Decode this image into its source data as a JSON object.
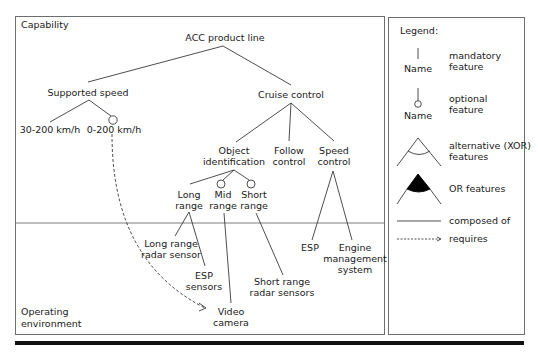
{
  "regions": {
    "capability": "Capability",
    "operating_environment_line1": "Operating",
    "operating_environment_line2": "environment"
  },
  "features": {
    "root": "ACC product line",
    "supported_speed": "Supported speed",
    "speed_30_200": "30-200 km/h",
    "speed_0_200": "0-200 km/h",
    "cruise_control": "Cruise control",
    "object_identification_1": "Object",
    "object_identification_2": "identification",
    "follow_control_1": "Follow",
    "follow_control_2": "control",
    "speed_control_1": "Speed",
    "speed_control_2": "control",
    "long_range_1": "Long",
    "long_range_2": "range",
    "mid_range_1": "Mid",
    "mid_range_2": "range",
    "short_range_1": "Short",
    "short_range_2": "range"
  },
  "environment": {
    "long_range_radar_1": "Long range",
    "long_range_radar_2": "radar sensor",
    "esp_sensors_1": "ESP",
    "esp_sensors_2": "sensors",
    "video_camera_1": "Video",
    "video_camera_2": "camera",
    "short_range_radar_1": "Short range",
    "short_range_radar_2": "radar sensors",
    "esp": "ESP",
    "engine_mgmt_1": "Engine",
    "engine_mgmt_2": "management",
    "engine_mgmt_3": "system"
  },
  "legend": {
    "title": "Legend:",
    "node_name": "Name",
    "mandatory_1": "mandatory",
    "mandatory_2": "feature",
    "optional_1": "optional",
    "optional_2": "feature",
    "alternative_1": "alternative (XOR)",
    "alternative_2": "features",
    "or": "OR features",
    "composed": "composed of",
    "requires": "requires"
  },
  "colors": {
    "line": "#3a3a3a",
    "border": "#6e6e6e",
    "text": "#1a1a1a"
  }
}
